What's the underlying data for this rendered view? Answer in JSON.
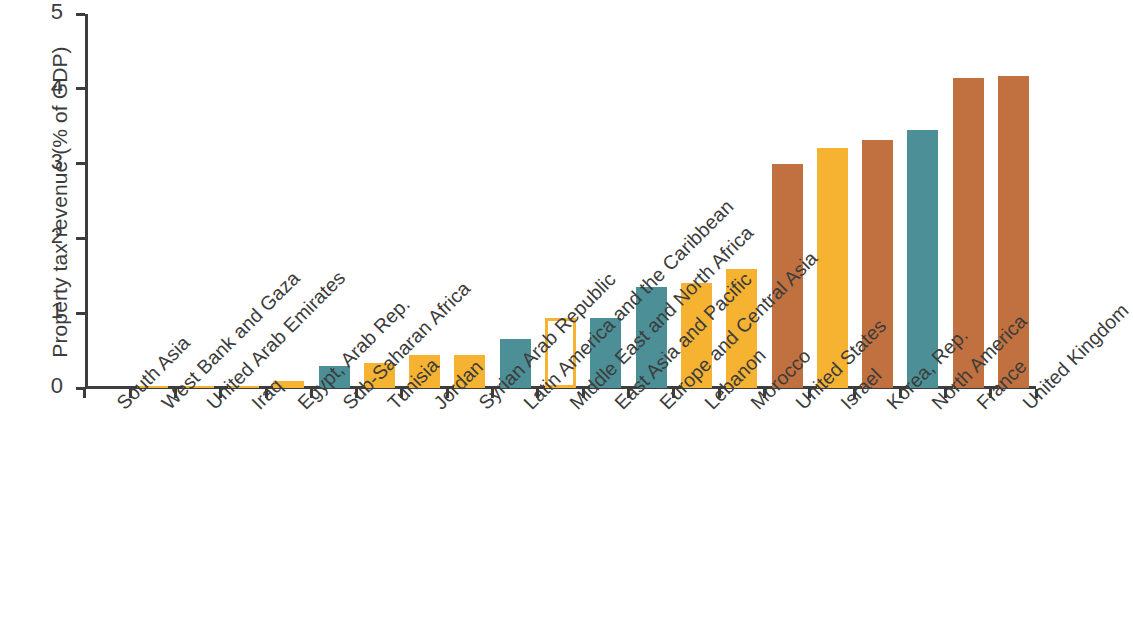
{
  "chart_data": {
    "type": "bar",
    "title": "",
    "xlabel": "",
    "ylabel": "Property tax revenue (% of GDP)",
    "ylim": [
      0,
      5
    ],
    "ytick_labels": [
      "0",
      "1",
      "2",
      "3",
      "4",
      "5"
    ],
    "ytick_values": [
      0,
      1,
      2,
      3,
      4,
      5
    ],
    "grid": false,
    "legend": "none",
    "categories": [
      "South Asia",
      "West Bank and Gaza",
      "United Arab Emirates",
      "Iraq",
      "Egypt, Arab Rep.",
      "Sub-Saharan Africa",
      "Tunisia",
      "Jordan",
      "Syrian Arab Republic",
      "Latin America and the Caribbean",
      "Middle East and North Africa",
      "East Asia and Pacific",
      "Europe and Central Asia",
      "Lebanon",
      "Morocco",
      "United States",
      "Israel",
      "Korea, Rep.",
      "North America",
      "France",
      "United Kingdom"
    ],
    "values": [
      0.0,
      0.005,
      0.02,
      0.03,
      0.1,
      0.3,
      0.33,
      0.44,
      0.44,
      0.66,
      0.93,
      0.94,
      1.35,
      1.4,
      1.59,
      2.99,
      3.21,
      3.32,
      3.45,
      4.14,
      4.17
    ],
    "bar_styles": [
      "yellow",
      "yellow",
      "yellow",
      "yellow",
      "yellow",
      "teal",
      "yellow",
      "yellow",
      "yellow",
      "teal",
      "hollow-yellow",
      "teal",
      "teal",
      "yellow",
      "yellow",
      "brown",
      "yellow",
      "brown",
      "teal",
      "brown",
      "brown"
    ],
    "colors": {
      "yellow": "#F6B332",
      "teal": "#4C8F96",
      "brown": "#C1713F",
      "hollow_fill": "#FFFFFF",
      "hollow_stroke": "#F6B332",
      "axis": "#3d3d3d",
      "text": "#3c3c3c",
      "background": "#FFFFFF"
    }
  }
}
